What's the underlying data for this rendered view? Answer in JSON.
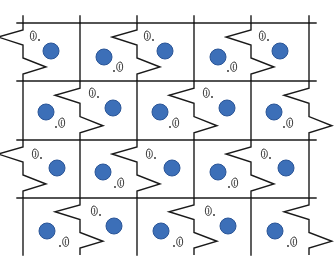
{
  "figure": {
    "title": "",
    "canvas": {
      "width": 334,
      "height": 263,
      "background": "#ffffff"
    },
    "grid": {
      "columns_x": [
        23,
        80,
        137,
        194,
        251,
        309
      ],
      "rows_y": [
        23,
        81,
        140,
        198,
        255
      ],
      "horizontal_line_extent": [
        17,
        316
      ],
      "horizontal_lines_y": [
        23,
        81,
        140,
        198
      ],
      "line_color": "#1a1a1a"
    },
    "zigzag": {
      "rule": "vertical boundary k in row j is zigzag when (k + j) is even",
      "shape_offsets": [
        [
          0,
          0
        ],
        [
          0,
          7
        ],
        [
          -25,
          14
        ],
        [
          0,
          22
        ],
        [
          0,
          35
        ],
        [
          23,
          44
        ],
        [
          0,
          51
        ],
        [
          0,
          58
        ]
      ]
    },
    "circle": {
      "fill": "#3c6fb8",
      "stroke": "#2a5597",
      "radius": 8
    },
    "icon": {
      "name": "ear-icon",
      "stroke": "#222222"
    },
    "cells": [
      {
        "row": 0,
        "col": 0,
        "circle": [
          51,
          51
        ],
        "icon": [
          33,
          36
        ],
        "icon_dir": "right"
      },
      {
        "row": 0,
        "col": 1,
        "circle": [
          104,
          57
        ],
        "icon": [
          120,
          67
        ],
        "icon_dir": "left"
      },
      {
        "row": 0,
        "col": 2,
        "circle": [
          165,
          51
        ],
        "icon": [
          147,
          36
        ],
        "icon_dir": "right"
      },
      {
        "row": 0,
        "col": 3,
        "circle": [
          218,
          57
        ],
        "icon": [
          234,
          67
        ],
        "icon_dir": "left"
      },
      {
        "row": 0,
        "col": 4,
        "circle": [
          280,
          51
        ],
        "icon": [
          262,
          36
        ],
        "icon_dir": "right"
      },
      {
        "row": 1,
        "col": 0,
        "circle": [
          46,
          112
        ],
        "icon": [
          62,
          123
        ],
        "icon_dir": "left"
      },
      {
        "row": 1,
        "col": 1,
        "circle": [
          113,
          108
        ],
        "icon": [
          92,
          93
        ],
        "icon_dir": "right"
      },
      {
        "row": 1,
        "col": 2,
        "circle": [
          160,
          112
        ],
        "icon": [
          176,
          123
        ],
        "icon_dir": "left"
      },
      {
        "row": 1,
        "col": 3,
        "circle": [
          227,
          108
        ],
        "icon": [
          206,
          93
        ],
        "icon_dir": "right"
      },
      {
        "row": 1,
        "col": 4,
        "circle": [
          274,
          112
        ],
        "icon": [
          290,
          123
        ],
        "icon_dir": "left"
      },
      {
        "row": 2,
        "col": 0,
        "circle": [
          57,
          168
        ],
        "icon": [
          35,
          154
        ],
        "icon_dir": "right"
      },
      {
        "row": 2,
        "col": 1,
        "circle": [
          103,
          172
        ],
        "icon": [
          121,
          183
        ],
        "icon_dir": "left"
      },
      {
        "row": 2,
        "col": 2,
        "circle": [
          172,
          168
        ],
        "icon": [
          149,
          154
        ],
        "icon_dir": "right"
      },
      {
        "row": 2,
        "col": 3,
        "circle": [
          218,
          172
        ],
        "icon": [
          235,
          183
        ],
        "icon_dir": "left"
      },
      {
        "row": 2,
        "col": 4,
        "circle": [
          286,
          168
        ],
        "icon": [
          264,
          154
        ],
        "icon_dir": "right"
      },
      {
        "row": 3,
        "col": 0,
        "circle": [
          47,
          231
        ],
        "icon": [
          66,
          242
        ],
        "icon_dir": "left"
      },
      {
        "row": 3,
        "col": 1,
        "circle": [
          114,
          226
        ],
        "icon": [
          94,
          211
        ],
        "icon_dir": "right"
      },
      {
        "row": 3,
        "col": 2,
        "circle": [
          161,
          231
        ],
        "icon": [
          180,
          242
        ],
        "icon_dir": "left"
      },
      {
        "row": 3,
        "col": 3,
        "circle": [
          228,
          226
        ],
        "icon": [
          208,
          211
        ],
        "icon_dir": "right"
      },
      {
        "row": 3,
        "col": 4,
        "circle": [
          275,
          231
        ],
        "icon": [
          294,
          242
        ],
        "icon_dir": "left"
      }
    ]
  }
}
